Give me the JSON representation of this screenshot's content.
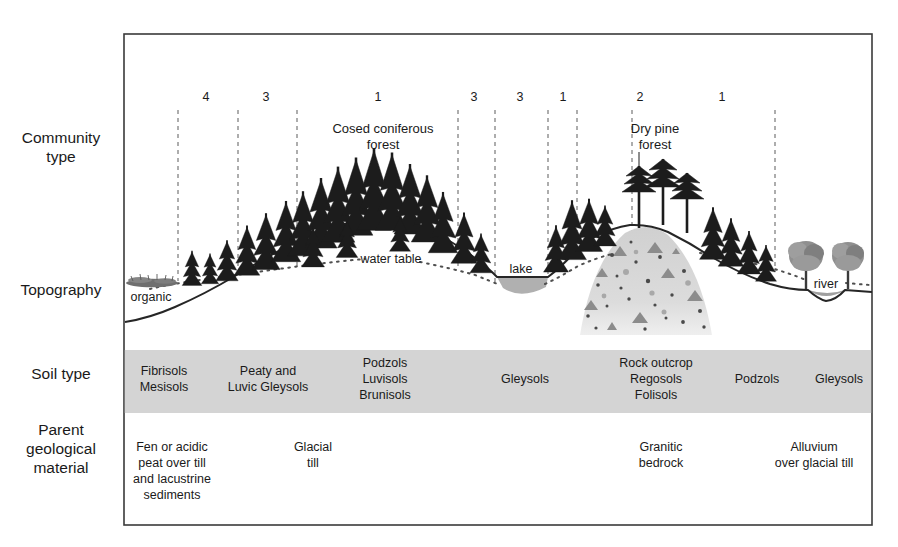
{
  "figure": {
    "frame": {
      "x": 124,
      "y": 34,
      "width": 748,
      "height": 491
    }
  },
  "row_labels": [
    {
      "name": "community-type",
      "lines": [
        "Community",
        "type"
      ],
      "y": 138
    },
    {
      "name": "topography",
      "lines": [
        "Topography"
      ],
      "y": 289
    },
    {
      "name": "soil-type",
      "lines": [
        "Soil type"
      ],
      "y": 373
    },
    {
      "name": "parent-geological-material",
      "lines": [
        "Parent",
        "geological",
        "material"
      ],
      "y": 438
    }
  ],
  "community_zone_numbers": [
    {
      "label": "4",
      "x": 206
    },
    {
      "label": "3",
      "x": 266
    },
    {
      "label": "1",
      "x": 378
    },
    {
      "label": "3",
      "x": 474
    },
    {
      "label": "3",
      "x": 520
    },
    {
      "label": "1",
      "x": 563
    },
    {
      "label": "2",
      "x": 640
    },
    {
      "label": "1",
      "x": 722
    }
  ],
  "zone_dividers_x": [
    178,
    238,
    297,
    458,
    495,
    548,
    577,
    632,
    775
  ],
  "community_labels": [
    {
      "name": "closed-coniferous-forest-label",
      "lines": [
        "Cosed coniferous",
        "forest"
      ],
      "x": 383,
      "y": 131
    },
    {
      "name": "dry-pine-forest-label",
      "lines": [
        "Dry pine",
        "forest"
      ],
      "x": 655,
      "y": 131
    }
  ],
  "topography_labels": [
    {
      "name": "organic-label",
      "text": "organic",
      "x": 151,
      "y": 299,
      "anchor": "middle"
    },
    {
      "name": "water-table-label",
      "text": "water table",
      "x": 391,
      "y": 262,
      "anchor": "middle"
    },
    {
      "name": "lake-label",
      "text": "lake",
      "x": 521,
      "y": 272,
      "anchor": "middle"
    },
    {
      "name": "river-label",
      "text": "river",
      "x": 826,
      "y": 287,
      "anchor": "middle"
    }
  ],
  "soil_type": {
    "band": {
      "y": 350,
      "height": 63,
      "fill": "#d4d4d4"
    },
    "entries": [
      {
        "lines": [
          "Fibrisols",
          "Mesisols"
        ],
        "x": 164
      },
      {
        "lines": [
          "Peaty and",
          "Luvic Gleysols"
        ],
        "x": 268
      },
      {
        "lines": [
          "Podzols",
          "Luvisols",
          "Brunisols"
        ],
        "x": 385
      },
      {
        "lines": [
          "Gleysols"
        ],
        "x": 525
      },
      {
        "lines": [
          "Rock outcrop",
          "Regosols",
          "Folisols"
        ],
        "x": 656
      },
      {
        "lines": [
          "Podzols"
        ],
        "x": 757
      },
      {
        "lines": [
          "Gleysols"
        ],
        "x": 839
      }
    ]
  },
  "parent_material": {
    "entries": [
      {
        "lines": [
          "Fen or acidic",
          "peat over till",
          "and lacustrine",
          "sediments"
        ],
        "x": 172,
        "y": 451
      },
      {
        "lines": [
          "Glacial",
          "till"
        ],
        "x": 313,
        "y": 451
      },
      {
        "lines": [
          "Granitic",
          "bedrock"
        ],
        "x": 661,
        "y": 451
      },
      {
        "lines": [
          "Alluvium",
          "over glacial till"
        ],
        "x": 814,
        "y": 451
      }
    ]
  },
  "colors": {
    "frame_stroke": "#3a3a3a",
    "divider_dash": "#6b6b6b",
    "ground_line": "#262626",
    "water_fill": "#b3b3b3",
    "soil_band": "#d4d4d4",
    "rock_hill": "#d8d8d8",
    "tree_dark": "#1c1c1c",
    "tree_green": "#8a8a8a",
    "organic_patch": "#777777",
    "text": "#1a1a1a"
  }
}
